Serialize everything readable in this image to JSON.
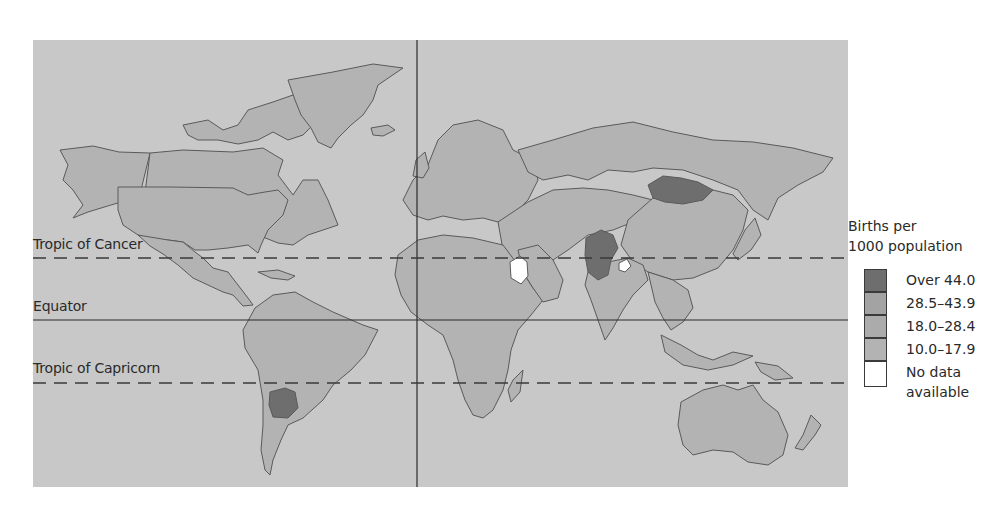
{
  "map": {
    "title": "Births per 1000 population",
    "reference_lines": {
      "tropic_of_cancer": "Tropic of Cancer",
      "equator": "Equator",
      "tropic_of_capricorn": "Tropic of Capricorn"
    },
    "colors": {
      "ocean": "#c8c8c8",
      "over_44": "#6e6e6e",
      "range_28_5_43_9": "#a3a3a3",
      "range_18_28_4": "#ababab",
      "range_10_17_9": "#b3b3b3",
      "no_data": "#ffffff",
      "border": "#5a5a5a"
    },
    "highlighted_regions": [
      {
        "region": "Mongolia",
        "category": "Over 44.0"
      },
      {
        "region": "Afghanistan",
        "category": "Over 44.0"
      },
      {
        "region": "Pakistan",
        "category": "Over 44.0"
      },
      {
        "region": "Bolivia",
        "category": "Over 44.0"
      },
      {
        "region": "Iraq",
        "category": "No data available"
      },
      {
        "region": "Kashmir",
        "category": "No data available"
      }
    ]
  },
  "legend": {
    "title_line1": "Births per",
    "title_line2": "1000 population",
    "items": [
      {
        "label": "Over 44.0",
        "color": "#6e6e6e"
      },
      {
        "label": "28.5–43.9",
        "color": "#a3a3a3"
      },
      {
        "label": "18.0–28.4",
        "color": "#ababab"
      },
      {
        "label": "10.0–17.9",
        "color": "#b3b3b3"
      },
      {
        "label_line1": "No data",
        "label_line2": "available",
        "color": "#ffffff"
      }
    ]
  }
}
